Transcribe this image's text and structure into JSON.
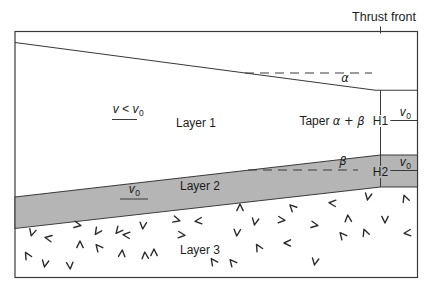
{
  "figure": {
    "thrust_front_label": "Thrust front",
    "layer1_label": "Layer 1",
    "layer2_label": "Layer 2",
    "layer3_label": "Layer 3",
    "taper_label_prefix": "Taper ",
    "taper_label_angles": "α + β",
    "alpha_label": "α",
    "beta_label": "β",
    "h1_label": "H1",
    "h2_label": "H2",
    "velocity_inequality": {
      "expr": "v < v",
      "sub": "0"
    },
    "v0": {
      "base": "v",
      "sub": "0"
    }
  },
  "colors": {
    "layer2_fill": "#b5b5b5",
    "line": "#3a3a3a",
    "text": "#1c1c1c",
    "background": "#ffffff"
  },
  "basement_symbols": [
    {
      "x": 32,
      "y": 233,
      "r": 15
    },
    {
      "x": 48,
      "y": 238,
      "r": 100
    },
    {
      "x": 27,
      "y": 255,
      "r": 150
    },
    {
      "x": 45,
      "y": 264,
      "r": 10
    },
    {
      "x": 70,
      "y": 266,
      "r": -5
    },
    {
      "x": 78,
      "y": 225,
      "r": -80
    },
    {
      "x": 97,
      "y": 232,
      "r": 35
    },
    {
      "x": 80,
      "y": 244,
      "r": 180
    },
    {
      "x": 98,
      "y": 247,
      "r": 140
    },
    {
      "x": 118,
      "y": 231,
      "r": 40
    },
    {
      "x": 122,
      "y": 253,
      "r": -175
    },
    {
      "x": 126,
      "y": 235,
      "r": 95
    },
    {
      "x": 143,
      "y": 226,
      "r": 5
    },
    {
      "x": 145,
      "y": 255,
      "r": 175
    },
    {
      "x": 154,
      "y": 252,
      "r": 180
    },
    {
      "x": 177,
      "y": 220,
      "r": -75
    },
    {
      "x": 182,
      "y": 235,
      "r": -85
    },
    {
      "x": 198,
      "y": 221,
      "r": 85
    },
    {
      "x": 213,
      "y": 261,
      "r": 145
    },
    {
      "x": 232,
      "y": 262,
      "r": 140
    },
    {
      "x": 240,
      "y": 207,
      "r": 180
    },
    {
      "x": 237,
      "y": 233,
      "r": 5
    },
    {
      "x": 255,
      "y": 222,
      "r": 10
    },
    {
      "x": 258,
      "y": 247,
      "r": 150
    },
    {
      "x": 282,
      "y": 220,
      "r": -85
    },
    {
      "x": 287,
      "y": 243,
      "r": 90
    },
    {
      "x": 292,
      "y": 207,
      "r": 135
    },
    {
      "x": 315,
      "y": 225,
      "r": -80
    },
    {
      "x": 315,
      "y": 262,
      "r": 10
    },
    {
      "x": 332,
      "y": 203,
      "r": 95
    },
    {
      "x": 342,
      "y": 235,
      "r": 140
    },
    {
      "x": 348,
      "y": 218,
      "r": 175
    },
    {
      "x": 365,
      "y": 232,
      "r": 160
    },
    {
      "x": 368,
      "y": 197,
      "r": 10
    },
    {
      "x": 385,
      "y": 220,
      "r": 0
    },
    {
      "x": 405,
      "y": 198,
      "r": 160
    },
    {
      "x": 407,
      "y": 233,
      "r": 85
    }
  ]
}
